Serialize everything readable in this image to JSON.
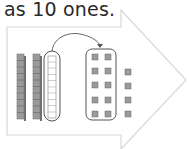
{
  "caption": "as 10 ones.",
  "figure": {
    "tens_rods_left": 2,
    "circled_rod_units": 10,
    "circled_ones": 10,
    "extra_ones": 4,
    "colors": {
      "arrow_outline": "#d8d8d8",
      "cube_fill": "#9a9a9a",
      "cube_dark": "#6f6f6f",
      "outline": "#555555"
    }
  }
}
